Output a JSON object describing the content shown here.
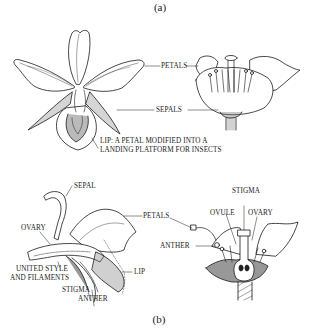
{
  "figure": {
    "panel_a": {
      "caption": "(a)",
      "labels": {
        "petals": "PETALS",
        "sepals": "SEPALS",
        "lip_line1": "LIP: A PETAL MODIFIED INTO A",
        "lip_line2": "LANDING PLATFORM FOR INSECTS"
      },
      "illustrations": [
        "orchid-flower-front-view",
        "regular-flower-side-view"
      ]
    },
    "panel_b": {
      "caption": "(b)",
      "labels": {
        "sepal": "SEPAL",
        "petals": "PETALS",
        "ovary_left": "OVARY",
        "united_line1": "UNITED STYLE",
        "united_line2": "AND FILAMENTS",
        "lip": "LIP",
        "stigma_left": "STIGMA",
        "anther_left": "ANTHER",
        "stigma_right": "STIGMA",
        "ovule": "OVULE",
        "ovary_right": "OVARY",
        "anther_right": "ANTHER"
      },
      "illustrations": [
        "orchid-longitudinal-section",
        "regular-flower-longitudinal-section"
      ]
    }
  },
  "colors": {
    "ink": "#1a1a1a",
    "background": "#ffffff",
    "shade": "#555555"
  }
}
